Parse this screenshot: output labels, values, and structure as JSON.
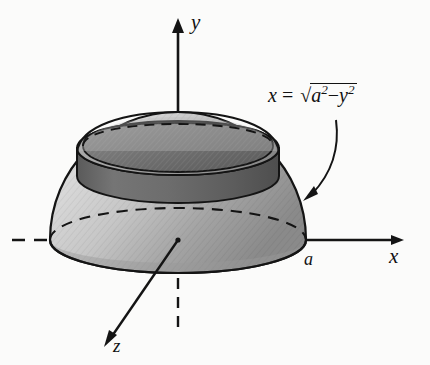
{
  "figure": {
    "kind": "3d-solid-of-revolution-diagram",
    "background_color": "#fbfbfa",
    "ink_color": "#111111"
  },
  "axes": {
    "y": {
      "label": "y",
      "orientation": "vertical-up",
      "arrow_tip": {
        "x": 178,
        "y": 20
      },
      "origin": {
        "x": 178,
        "y": 240
      },
      "style": "solid above solid, dashed inside solid"
    },
    "x": {
      "label": "x",
      "orientation": "horizontal-right",
      "arrow_tip": {
        "x": 404,
        "y": 240
      },
      "origin": {
        "x": 178,
        "y": 240
      },
      "style": "dashed left of solid and through solid, solid to the right"
    },
    "z": {
      "label": "z",
      "orientation": "diagonal-down-left",
      "arrow_tip": {
        "x": 104,
        "y": 346
      },
      "origin": {
        "x": 178,
        "y": 240
      },
      "style": "solid in front, dashed behind the solid"
    }
  },
  "tick_labels": {
    "x_intercept": "a"
  },
  "annotation": {
    "equation": {
      "lhs": "x",
      "equals": "=",
      "radical": "√",
      "radicand_first": "a",
      "radicand_first_exp": "2",
      "minus": "−",
      "radicand_second": "y",
      "radicand_second_exp": "2",
      "plain_text": "x = √(a² − y²)"
    },
    "leader_arrow": {
      "from": {
        "x": 336,
        "y": 120
      },
      "to": {
        "x": 303,
        "y": 201
      },
      "shape": "curved"
    }
  },
  "solid": {
    "outer_surface_fill_light": "#dedede",
    "outer_surface_fill_mid": "#b6b6b6",
    "outer_surface_fill_dark": "#8d8d8d",
    "band_fill": "#6f6f6f",
    "band_fill_dark": "#585858",
    "inner_cap_fill": "#757575",
    "stroke": "#141414",
    "radius_px": 128,
    "center": {
      "x": 178,
      "y": 240
    },
    "ellipse_ry_ratio": 0.3,
    "base_ellipse": {
      "cx": 178,
      "cy": 240,
      "rx": 128,
      "ry": 33
    },
    "band_top_ellipse": {
      "cx": 178,
      "cy": 148,
      "rx": 101,
      "ry": 27
    },
    "band_bottom_ellipse": {
      "cx": 178,
      "cy": 176,
      "rx": 101,
      "ry": 27
    },
    "dome_apex": {
      "x": 178,
      "y": 112
    }
  }
}
